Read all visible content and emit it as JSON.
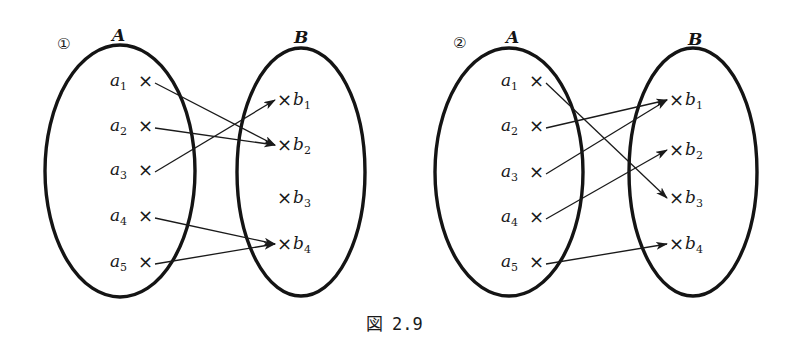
{
  "caption": {
    "prefix": "図",
    "number": "2.9"
  },
  "colors": {
    "ink": "#141414",
    "background": "#ffffff"
  },
  "diagrams": [
    {
      "id": "1",
      "marker": "①",
      "set_a": {
        "name": "A",
        "ellipse": {
          "cx": 120,
          "cy": 171,
          "rx": 75,
          "ry": 126
        },
        "label_pos": [
          118,
          36
        ]
      },
      "set_b": {
        "name": "B",
        "ellipse": {
          "cx": 301,
          "cy": 172,
          "rx": 64,
          "ry": 124
        },
        "label_pos": [
          300,
          38
        ]
      },
      "marker_pos": [
        66,
        43
      ],
      "a_elements": [
        {
          "base": "a",
          "sub": "1",
          "x": 144,
          "y": 81
        },
        {
          "base": "a",
          "sub": "2",
          "x": 144,
          "y": 126
        },
        {
          "base": "a",
          "sub": "3",
          "x": 144,
          "y": 170
        },
        {
          "base": "a",
          "sub": "4",
          "x": 144,
          "y": 216
        },
        {
          "base": "a",
          "sub": "5",
          "x": 144,
          "y": 262
        }
      ],
      "b_elements": [
        {
          "base": "b",
          "sub": "1",
          "x": 283,
          "y": 100
        },
        {
          "base": "b",
          "sub": "2",
          "x": 283,
          "y": 145
        },
        {
          "base": "b",
          "sub": "3",
          "x": 283,
          "y": 198
        },
        {
          "base": "b",
          "sub": "4",
          "x": 283,
          "y": 244
        }
      ],
      "mapping": [
        {
          "from": "a1",
          "to": "b2"
        },
        {
          "from": "a2",
          "to": "b2"
        },
        {
          "from": "a3",
          "to": "b1"
        },
        {
          "from": "a4",
          "to": "b4"
        },
        {
          "from": "a5",
          "to": "b4"
        }
      ]
    },
    {
      "id": "2",
      "marker": "②",
      "set_a": {
        "name": "A",
        "ellipse": {
          "cx": 509,
          "cy": 172,
          "rx": 74,
          "ry": 124
        },
        "label_pos": [
          512,
          38
        ]
      },
      "set_b": {
        "name": "B",
        "ellipse": {
          "cx": 693,
          "cy": 172,
          "rx": 64,
          "ry": 124
        },
        "label_pos": [
          694,
          40
        ]
      },
      "marker_pos": [
        462,
        42
      ],
      "a_elements": [
        {
          "base": "a",
          "sub": "1",
          "x": 535,
          "y": 81
        },
        {
          "base": "a",
          "sub": "2",
          "x": 535,
          "y": 126
        },
        {
          "base": "a",
          "sub": "3",
          "x": 535,
          "y": 172
        },
        {
          "base": "a",
          "sub": "4",
          "x": 535,
          "y": 217
        },
        {
          "base": "a",
          "sub": "5",
          "x": 535,
          "y": 262
        }
      ],
      "b_elements": [
        {
          "base": "b",
          "sub": "1",
          "x": 675,
          "y": 100
        },
        {
          "base": "b",
          "sub": "2",
          "x": 675,
          "y": 150
        },
        {
          "base": "b",
          "sub": "3",
          "x": 675,
          "y": 198
        },
        {
          "base": "b",
          "sub": "4",
          "x": 675,
          "y": 244
        }
      ],
      "mapping": [
        {
          "from": "a1",
          "to": "b3"
        },
        {
          "from": "a2",
          "to": "b1"
        },
        {
          "from": "a3",
          "to": "b1"
        },
        {
          "from": "a4",
          "to": "b2"
        },
        {
          "from": "a5",
          "to": "b4"
        }
      ]
    }
  ]
}
